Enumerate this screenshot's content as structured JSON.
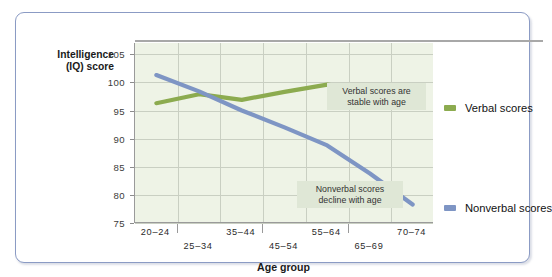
{
  "figure": {
    "y_axis_title_lines": [
      "Intelligence",
      "(IQ) score"
    ],
    "x_axis_title": "Age group"
  },
  "annotations": {
    "verbal": "Verbal scores are\nstable with age",
    "nonverbal": "Nonverbal scores\ndecline with age"
  },
  "legend": {
    "items": [
      {
        "label": "Verbal scores",
        "color": "#8cab4f"
      },
      {
        "label": "Nonverbal scores",
        "color": "#7e95c4"
      }
    ]
  },
  "chart_data": {
    "type": "line",
    "title": "",
    "xlabel": "Age group",
    "ylabel": "Intelligence (IQ) score",
    "categories": [
      "20–24",
      "25–34",
      "35–44",
      "45–54",
      "55–64",
      "65–69",
      "70–74"
    ],
    "yticks": [
      75,
      80,
      85,
      90,
      95,
      100,
      105
    ],
    "ylim": [
      75,
      107
    ],
    "grid": true,
    "legend_position": "right",
    "series": [
      {
        "name": "Verbal scores",
        "color": "#8cab4f",
        "values": [
          96.3,
          97.9,
          96.9,
          98.3,
          99.6,
          98.5,
          97.2
        ]
      },
      {
        "name": "Nonverbal scores",
        "color": "#7e95c4",
        "values": [
          101.3,
          98.4,
          95.0,
          92.0,
          88.8,
          83.8,
          78.3
        ]
      }
    ],
    "annotations": [
      {
        "text": "Verbal scores are stable with age",
        "series": "Verbal scores"
      },
      {
        "text": "Nonverbal scores decline with age",
        "series": "Nonverbal scores"
      }
    ]
  }
}
